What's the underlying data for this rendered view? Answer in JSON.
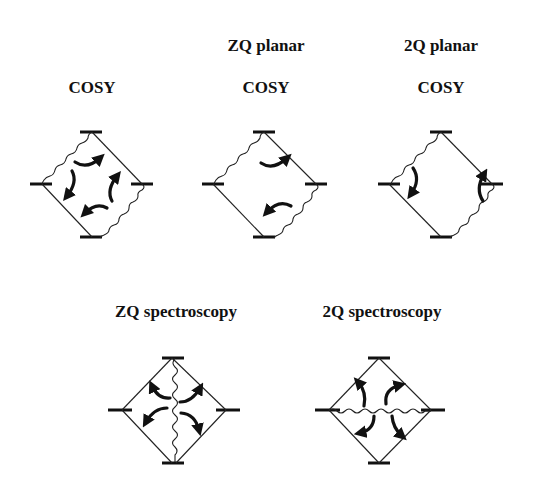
{
  "labels": {
    "cosy": {
      "line1": "",
      "line2": "COSY"
    },
    "zq_planar": {
      "line1": "ZQ planar",
      "line2": "COSY"
    },
    "dq_planar": {
      "line1": "2Q planar",
      "line2": "COSY"
    },
    "zq_spec": {
      "line1": "ZQ spectroscopy"
    },
    "dq_spec": {
      "line1": "2Q spectroscopy"
    }
  },
  "diagrams": [
    {
      "id": "cosy",
      "wavy_edges": [
        "top-left",
        "right-bottom"
      ],
      "straight_edges": [
        "top-right",
        "left-bottom"
      ],
      "internal_wavy": "none",
      "arrows": 4
    },
    {
      "id": "zq_planar",
      "wavy_edges": [
        "top-left",
        "right-bottom"
      ],
      "straight_edges": [
        "top-right",
        "left-bottom"
      ],
      "internal_wavy": "none",
      "arrows": 2,
      "arrow_orientation": "horizontal"
    },
    {
      "id": "dq_planar",
      "wavy_edges": [
        "top-left",
        "right-bottom"
      ],
      "straight_edges": [
        "top-right",
        "left-bottom"
      ],
      "internal_wavy": "none",
      "arrows": 2,
      "arrow_orientation": "vertical"
    },
    {
      "id": "zq_spec",
      "wavy_edges": [],
      "straight_edges": [
        "top-left",
        "top-right",
        "left-bottom",
        "right-bottom"
      ],
      "internal_wavy": "vertical",
      "arrows": 4
    },
    {
      "id": "dq_spec",
      "wavy_edges": [],
      "straight_edges": [
        "top-left",
        "top-right",
        "left-bottom",
        "right-bottom"
      ],
      "internal_wavy": "horizontal",
      "arrows": 4
    }
  ],
  "colors": {
    "line": "#222222",
    "background": "#ffffff"
  }
}
